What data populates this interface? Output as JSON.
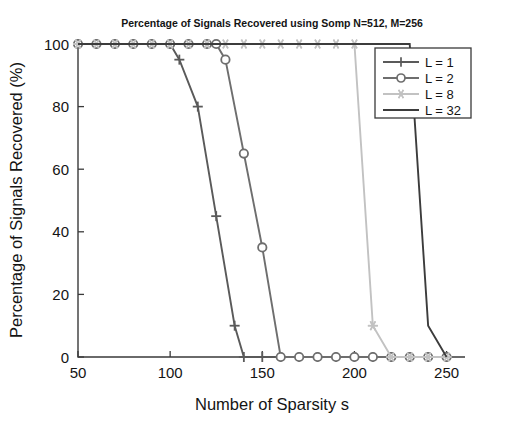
{
  "chart_data": {
    "type": "line",
    "title": "Percentage of Signals Recovered using Somp N=512, M=256",
    "xlabel": "Number of Sparsity s",
    "ylabel": "Percentage of Signals Recovered (%)",
    "xlim": [
      50,
      260
    ],
    "ylim": [
      0,
      100
    ],
    "xticks": [
      50,
      100,
      150,
      200,
      250
    ],
    "yticks": [
      0,
      20,
      40,
      60,
      80,
      100
    ],
    "grid": false,
    "legend_position": "upper right",
    "series": [
      {
        "name": "L = 1",
        "marker": "plus",
        "color": "#5a5a5a",
        "x": [
          50,
          60,
          70,
          80,
          90,
          100,
          105,
          115,
          125,
          135,
          140,
          150,
          160,
          170,
          180,
          190,
          200,
          210,
          220,
          230,
          240,
          250
        ],
        "y": [
          100,
          100,
          100,
          100,
          100,
          100,
          95,
          80,
          45,
          10,
          0,
          0,
          0,
          0,
          0,
          0,
          0,
          0,
          0,
          0,
          0,
          0
        ]
      },
      {
        "name": "L = 2",
        "marker": "circle",
        "color": "#6e6e6e",
        "x": [
          50,
          60,
          70,
          80,
          90,
          100,
          110,
          120,
          125,
          130,
          140,
          150,
          160,
          170,
          180,
          190,
          200,
          210,
          220,
          230,
          240,
          250
        ],
        "y": [
          100,
          100,
          100,
          100,
          100,
          100,
          100,
          100,
          100,
          95,
          65,
          35,
          0,
          0,
          0,
          0,
          0,
          0,
          0,
          0,
          0,
          0
        ]
      },
      {
        "name": "L = 8",
        "marker": "star",
        "color": "#c2c2c2",
        "x": [
          50,
          60,
          70,
          80,
          90,
          100,
          110,
          120,
          130,
          140,
          150,
          160,
          170,
          180,
          190,
          200,
          210,
          220,
          230,
          240,
          250
        ],
        "y": [
          100,
          100,
          100,
          100,
          100,
          100,
          100,
          100,
          100,
          100,
          100,
          100,
          100,
          100,
          100,
          100,
          10,
          0,
          0,
          0,
          0
        ]
      },
      {
        "name": "L = 32",
        "marker": "none",
        "color": "#3c3c3c",
        "x": [
          50,
          60,
          70,
          80,
          90,
          100,
          110,
          120,
          130,
          140,
          150,
          160,
          170,
          180,
          190,
          200,
          210,
          220,
          230,
          240,
          250
        ],
        "y": [
          100,
          100,
          100,
          100,
          100,
          100,
          100,
          100,
          100,
          100,
          100,
          100,
          100,
          100,
          100,
          100,
          100,
          100,
          100,
          10,
          0
        ]
      }
    ],
    "legend_entries": [
      {
        "label": "L = 1",
        "marker": "plus",
        "color": "#5a5a5a"
      },
      {
        "label": "L = 2",
        "marker": "circle",
        "color": "#6e6e6e"
      },
      {
        "label": "L = 8",
        "marker": "star",
        "color": "#c2c2c2"
      },
      {
        "label": "L = 32",
        "marker": "none",
        "color": "#3c3c3c"
      }
    ]
  }
}
